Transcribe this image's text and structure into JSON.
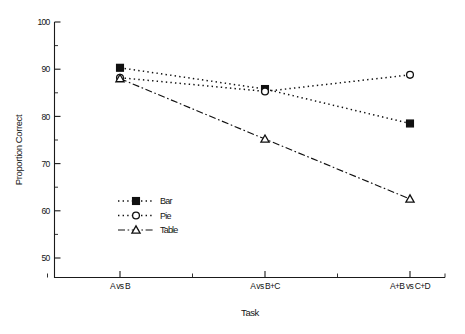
{
  "chart_data": {
    "type": "line",
    "title": "",
    "xlabel": "Task",
    "ylabel": "Proportion Correct",
    "categories": [
      "A vs B",
      "A vs B+C",
      "A+B vs C+D"
    ],
    "ylim": [
      50,
      100
    ],
    "ytick_labels": [
      "100",
      "90",
      "80",
      "70",
      "60",
      "50"
    ],
    "ytick_values": [
      100,
      90,
      80,
      70,
      60,
      50
    ],
    "yminor_values": [
      95,
      85,
      75,
      65,
      55
    ],
    "grid": "off",
    "legend_position": "lower-left-inside",
    "series": [
      {
        "name": "Bar",
        "values": [
          90.3,
          85.8,
          78.5
        ],
        "marker": "filled-square",
        "line_style": "dotted"
      },
      {
        "name": "Pie",
        "values": [
          88.2,
          85.3,
          88.8
        ],
        "marker": "open-circle",
        "line_style": "dotted"
      },
      {
        "name": "Table",
        "values": [
          88.0,
          75.2,
          62.5
        ],
        "marker": "open-triangle",
        "line_style": "dash-dot"
      }
    ]
  },
  "axes": {
    "y_axis_title": "Proportion Correct",
    "x_axis_title": "Task"
  },
  "legend": {
    "entries": [
      {
        "label": "Bar"
      },
      {
        "label": "Pie"
      },
      {
        "label": "Table"
      }
    ]
  },
  "colors": {
    "ink": "#101010",
    "background": "#ffffff"
  }
}
